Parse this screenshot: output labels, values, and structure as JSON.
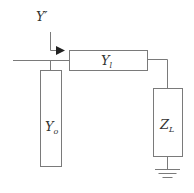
{
  "diagram": {
    "type": "circuit",
    "labels": {
      "input_admittance": {
        "main": "Y",
        "sup": "′"
      },
      "series_element": {
        "main": "Y",
        "sub": "l"
      },
      "shunt_element": {
        "main": "Y",
        "sub": "o"
      },
      "load": {
        "main": "Z",
        "sub": "L"
      }
    },
    "colors": {
      "line": "#7a7a7a",
      "text": "#333333",
      "background": "#ffffff"
    }
  }
}
